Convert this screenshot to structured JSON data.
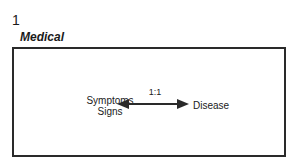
{
  "figure": {
    "number": "1",
    "title": "Medical"
  },
  "diagram": {
    "left_node": {
      "line1": "Symptoms",
      "line2": "Signs"
    },
    "right_node": "Disease",
    "relation_label": "1:1",
    "relation_type": "bidirectional-arrow"
  },
  "colors": {
    "stroke": "#2a2a2a",
    "background": "#ffffff"
  }
}
